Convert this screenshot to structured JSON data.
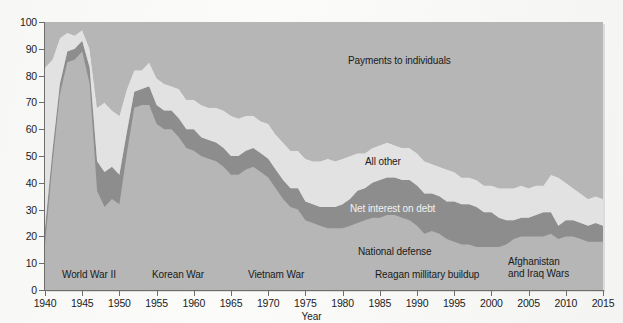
{
  "figure": {
    "background_color": "#fdfdfd",
    "plot_background_color": "#b6b6b6"
  },
  "axes": {
    "y_title": "Percentage",
    "x_title": "Year",
    "y_ticks": [
      "0",
      "10",
      "20",
      "30",
      "40",
      "50",
      "60",
      "70",
      "80",
      "90",
      "100"
    ],
    "x_ticks": [
      "1940",
      "1945",
      "1950",
      "1955",
      "1960",
      "1965",
      "1970",
      "1975",
      "1980",
      "1985",
      "1990",
      "1995",
      "2000",
      "2005",
      "2010",
      "2015"
    ]
  },
  "band_labels": [
    {
      "name": "payments-to-individuals",
      "text": "Payments to individuals",
      "x": 348,
      "y": 55,
      "light": false
    },
    {
      "name": "all-other",
      "text": "All other",
      "x": 365,
      "y": 156,
      "light": false
    },
    {
      "name": "net-interest-on-debt",
      "text": "Net interest on debt",
      "x": 350,
      "y": 203,
      "light": true
    },
    {
      "name": "national-defense",
      "text": "National defense",
      "x": 358,
      "y": 246,
      "light": false
    }
  ],
  "era_labels": [
    {
      "name": "world-war-ii",
      "lines": [
        "World War II"
      ],
      "x": 62,
      "y": 269
    },
    {
      "name": "korean-war",
      "lines": [
        "Korean War"
      ],
      "x": 152,
      "y": 269
    },
    {
      "name": "vietnam-war",
      "lines": [
        "Vietnam War"
      ],
      "x": 248,
      "y": 269
    },
    {
      "name": "reagan-millitary-buildup",
      "lines": [
        "Reagan millitary buildup"
      ],
      "x": 375,
      "y": 269
    },
    {
      "name": "afghanistan-and-iraq-wars",
      "lines": [
        "Afghanistan",
        "and Iraq Wars"
      ],
      "x": 508,
      "y": 256
    }
  ],
  "chart_data": {
    "type": "area",
    "stacked": true,
    "title": "",
    "xlabel": "Year",
    "ylabel": "Percentage",
    "xlim": [
      1940,
      2015
    ],
    "ylim": [
      0,
      100
    ],
    "grid": false,
    "legend_position": "inline-annotations",
    "colors": {
      "national_defense": "#b6b6b6",
      "net_interest_on_debt": "#8d8d8d",
      "all_other": "#e2e2e2",
      "payments_to_individuals": "#b6b6b6",
      "axis": "#6d6d6d",
      "text": "#1a1a1a",
      "text_light": "#f2f2f2"
    },
    "x": [
      1940,
      1941,
      1942,
      1943,
      1944,
      1945,
      1946,
      1947,
      1948,
      1949,
      1950,
      1951,
      1952,
      1953,
      1954,
      1955,
      1956,
      1957,
      1958,
      1959,
      1960,
      1961,
      1962,
      1963,
      1964,
      1965,
      1966,
      1967,
      1968,
      1969,
      1970,
      1971,
      1972,
      1973,
      1974,
      1975,
      1976,
      1977,
      1978,
      1979,
      1980,
      1981,
      1982,
      1983,
      1984,
      1985,
      1986,
      1987,
      1988,
      1989,
      1990,
      1991,
      1992,
      1993,
      1994,
      1995,
      1996,
      1997,
      1998,
      1999,
      2000,
      2001,
      2002,
      2003,
      2004,
      2005,
      2006,
      2007,
      2008,
      2009,
      2010,
      2011,
      2012,
      2013,
      2014,
      2015
    ],
    "series": [
      {
        "name": "National defense",
        "order": 1,
        "values": [
          17,
          47,
          73,
          85,
          86,
          89,
          77,
          37,
          31,
          34,
          32,
          51,
          68,
          69,
          69,
          62,
          60,
          60,
          57,
          53,
          52,
          50,
          49,
          48,
          46,
          43,
          43,
          45,
          46,
          44,
          42,
          38,
          34,
          31,
          30,
          26,
          25,
          24,
          23,
          23,
          23,
          24,
          25,
          26,
          27,
          27,
          28,
          28,
          27,
          26,
          24,
          21,
          22,
          21,
          19,
          18,
          17,
          17,
          16,
          16,
          16,
          16,
          17,
          19,
          20,
          20,
          20,
          20,
          21,
          19,
          20,
          20,
          19,
          18,
          18,
          18
        ]
      },
      {
        "name": "Net interest on debt",
        "order": 2,
        "values": [
          6,
          5,
          4,
          4,
          4,
          4,
          6,
          11,
          13,
          12,
          11,
          8,
          6,
          6,
          7,
          7,
          7,
          7,
          7,
          7,
          8,
          7,
          7,
          7,
          7,
          7,
          7,
          7,
          7,
          7,
          7,
          7,
          7,
          7,
          8,
          7,
          7,
          7,
          8,
          8,
          9,
          10,
          12,
          12,
          13,
          14,
          14,
          14,
          14,
          15,
          15,
          15,
          14,
          14,
          14,
          15,
          15,
          15,
          15,
          13,
          13,
          11,
          9,
          7,
          7,
          7,
          8,
          9,
          8,
          5,
          6,
          6,
          6,
          6,
          7,
          6
        ]
      },
      {
        "name": "All other",
        "order": 3,
        "values": [
          60,
          34,
          17,
          7,
          5,
          4,
          7,
          20,
          26,
          21,
          22,
          16,
          8,
          7,
          9,
          10,
          10,
          9,
          11,
          11,
          11,
          12,
          12,
          13,
          14,
          15,
          14,
          13,
          12,
          12,
          13,
          13,
          14,
          14,
          14,
          16,
          16,
          17,
          18,
          17,
          17,
          16,
          14,
          13,
          13,
          13,
          13,
          12,
          12,
          12,
          12,
          12,
          11,
          11,
          12,
          11,
          10,
          10,
          10,
          10,
          10,
          11,
          12,
          12,
          12,
          11,
          11,
          10,
          14,
          18,
          14,
          12,
          11,
          10,
          10,
          10
        ]
      },
      {
        "name": "Payments to individuals",
        "order": 4,
        "values": [
          17,
          14,
          6,
          4,
          5,
          3,
          10,
          32,
          30,
          33,
          35,
          25,
          18,
          18,
          15,
          21,
          23,
          24,
          25,
          29,
          29,
          31,
          32,
          32,
          33,
          35,
          36,
          35,
          35,
          37,
          38,
          42,
          45,
          48,
          48,
          51,
          52,
          52,
          51,
          52,
          51,
          50,
          49,
          49,
          47,
          46,
          45,
          46,
          47,
          47,
          49,
          52,
          53,
          54,
          55,
          56,
          58,
          58,
          59,
          61,
          61,
          62,
          62,
          62,
          61,
          62,
          61,
          61,
          57,
          58,
          60,
          62,
          64,
          66,
          65,
          66
        ]
      }
    ]
  }
}
